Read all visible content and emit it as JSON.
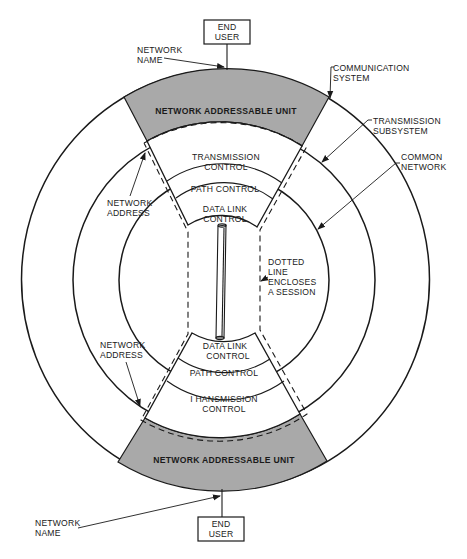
{
  "diagram": {
    "top_end_user": {
      "line1": "END",
      "line2": "USER"
    },
    "bottom_end_user": {
      "line1": "END",
      "line2": "USER"
    },
    "top_network_name": {
      "line1": "NETWORK",
      "line2": "NAME"
    },
    "bottom_network_name": {
      "line1": "NETWORK",
      "line2": "NAME"
    },
    "communication_system": {
      "line1": "COMMUNICATION",
      "line2": "SYSTEM"
    },
    "transmission_subsystem": {
      "line1": "TRANSMISSION",
      "line2": "SUBSYSTEM"
    },
    "common_network": {
      "line1": "COMMON",
      "line2": "NETWORK"
    },
    "top_network_address": {
      "line1": "NETWORK",
      "line2": "ADDRESS"
    },
    "bottom_network_address": {
      "line1": "NETWORK",
      "line2": "ADDRESS"
    },
    "top_nau": "NETWORK ADDRESSABLE UNIT",
    "bottom_nau": "NETWORK ADDRESSABLE UNIT",
    "top_layers": {
      "transmission_control": {
        "line1": "TRANSMISSION",
        "line2": "CONTROL"
      },
      "path_control": "PATH CONTROL",
      "data_link_control": {
        "line1": "DATA LINK",
        "line2": "CONTROL"
      }
    },
    "bottom_layers": {
      "data_link_control": {
        "line1": "DATA LINK",
        "line2": "CONTROL"
      },
      "path_control": "PATH CONTROL",
      "transmission_control": {
        "line1": "I HANSMISSION",
        "line2": "CONTROL"
      }
    },
    "session_note": {
      "line1": "DOTTED",
      "line2": "LINE",
      "line3": "ENCLOSES",
      "line4": "A SESSION"
    },
    "colors": {
      "nau_fill": "#a9a9a9",
      "ink": "#1a1a1a",
      "background": "#ffffff"
    }
  }
}
